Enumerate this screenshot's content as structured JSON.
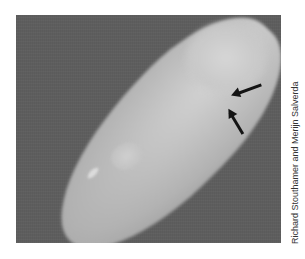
{
  "figure": {
    "colors": {
      "background": "#5e5e5e",
      "cell_body": "#b8b8b8",
      "cell_bright_tip": "#d0d0d0",
      "arrows": "#141414",
      "page": "#ffffff"
    },
    "annotations": [
      {
        "type": "arrow",
        "direction": "pointing left-down toward cell edge"
      },
      {
        "type": "arrow",
        "direction": "pointing up-left toward cell edge"
      }
    ],
    "credit": "Richard Stouthamer and Merijn Salverda"
  }
}
